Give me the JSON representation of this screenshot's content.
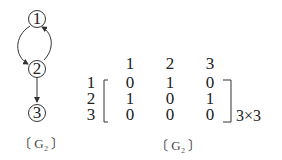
{
  "graph": {
    "nodes": [
      {
        "label": "1"
      },
      {
        "label": "2"
      },
      {
        "label": "3"
      }
    ],
    "edges": [
      {
        "from": "1",
        "to": "2"
      },
      {
        "from": "2",
        "to": "1"
      },
      {
        "from": "2",
        "to": "3"
      }
    ],
    "caption": "〔 G₂ 〕"
  },
  "matrix": {
    "col_headers": [
      "1",
      "2",
      "3"
    ],
    "row_headers": [
      "1",
      "2",
      "3"
    ],
    "rows": [
      [
        "0",
        "1",
        "0"
      ],
      [
        "1",
        "0",
        "1"
      ],
      [
        "0",
        "0",
        "0"
      ]
    ],
    "size_label": "3×3",
    "caption": "〔 G₂ 〕"
  }
}
